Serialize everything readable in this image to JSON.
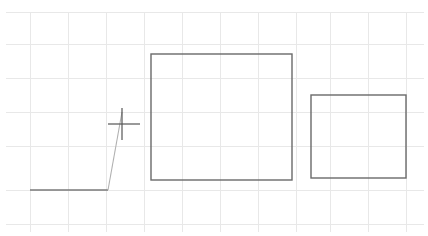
{
  "canvas": {
    "width": 428,
    "height": 236,
    "background": "#ffffff",
    "title": "CAD line drawing with grid",
    "description": "Monochrome technical sketch: a light grey background grid, two open-top rectangular outlines, a horizontal baseline with a rising diagonal, and a crosshair point marker."
  },
  "colors": {
    "background": "#ffffff",
    "grid": "#e8e8e8",
    "grid_faint": "#ededed",
    "shape_stroke": "#6a6a6a",
    "baseline_stroke": "#7a7a7a",
    "diagonal_stroke": "#b0b0b0",
    "crosshair_stroke": "#555555"
  },
  "grid": {
    "visible": true,
    "line_color": "#e8e8e8",
    "line_width": 1,
    "vertical_x": [
      30,
      68,
      106,
      144,
      182,
      220,
      258,
      296,
      330,
      368,
      406
    ],
    "vertical_y_start": 12,
    "vertical_y_end": 232,
    "horizontal_y": [
      12,
      44,
      78,
      112,
      146,
      190,
      224
    ],
    "horizontal_x_start": 6,
    "horizontal_x_end": 424
  },
  "shapes": [
    {
      "name": "large-rectangle",
      "type": "rectangle",
      "x": 151,
      "y": 54,
      "width": 141,
      "height": 126,
      "stroke": "#6a6a6a",
      "stroke_width": 1.4,
      "fill": "none"
    },
    {
      "name": "small-rectangle",
      "type": "rectangle",
      "x": 311,
      "y": 95,
      "width": 95,
      "height": 83,
      "stroke": "#6a6a6a",
      "stroke_width": 1.4,
      "fill": "none"
    }
  ],
  "lines": [
    {
      "name": "baseline",
      "type": "line",
      "x1": 30,
      "y1": 190,
      "x2": 108,
      "y2": 190,
      "stroke": "#7a7a7a",
      "stroke_width": 1.6
    },
    {
      "name": "diagonal-ramp",
      "type": "line",
      "x1": 108,
      "y1": 190,
      "x2": 122,
      "y2": 112,
      "stroke": "#b0b0b0",
      "stroke_width": 1.1
    }
  ],
  "markers": [
    {
      "name": "crosshair-marker",
      "type": "crosshair",
      "center_x": 122,
      "center_y": 124,
      "arm_left": 108,
      "arm_right": 140,
      "arm_top": 108,
      "arm_bottom": 140,
      "stroke": "#555555",
      "stroke_width": 1.2
    }
  ]
}
